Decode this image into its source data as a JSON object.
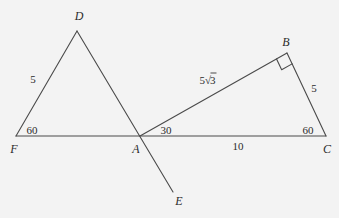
{
  "figure": {
    "background_color": "#f3f3f3",
    "stroke_color": "#4a4a4a",
    "text_color": "#2b2b2b",
    "width": 339,
    "height": 218
  },
  "points": {
    "F": {
      "label": "F",
      "x": 16,
      "y": 136,
      "label_x": 14,
      "label_y": 149
    },
    "A": {
      "label": "A",
      "x": 140,
      "y": 136,
      "label_x": 136,
      "label_y": 149
    },
    "C": {
      "label": "C",
      "x": 326,
      "y": 136,
      "label_x": 327,
      "label_y": 149
    },
    "D": {
      "label": "D",
      "x": 77,
      "y": 31,
      "label_x": 79,
      "label_y": 16
    },
    "B": {
      "label": "B",
      "x": 287,
      "y": 53,
      "label_x": 286,
      "label_y": 42
    },
    "E": {
      "label": "E",
      "x": 173,
      "y": 192,
      "label_x": 179,
      "label_y": 201
    }
  },
  "segments": [
    {
      "name": "baseline-F-C",
      "from": "F",
      "to": "C"
    },
    {
      "name": "side-F-D",
      "from": "F",
      "to": "D"
    },
    {
      "name": "ray-D-E",
      "from": "D",
      "to": "E"
    },
    {
      "name": "side-A-B",
      "from": "A",
      "to": "B"
    },
    {
      "name": "side-B-C",
      "from": "B",
      "to": "C"
    }
  ],
  "right_angle_marker": {
    "name": "right-angle-at-B",
    "vertex": "B",
    "size": 12
  },
  "measures": {
    "fd_length": {
      "text": "5",
      "x": 33,
      "y": 79
    },
    "angle_f": {
      "text": "60",
      "x": 32,
      "y": 130
    },
    "angle_a": {
      "text": "30",
      "x": 166,
      "y": 130
    },
    "ab_length_prefix": "5",
    "ab_length_radicand": "3",
    "ab_length_x": 208,
    "ab_length_y": 80,
    "bc_length": {
      "text": "5",
      "x": 314,
      "y": 88
    },
    "ac_length": {
      "text": "10",
      "x": 238,
      "y": 146
    },
    "angle_c": {
      "text": "60",
      "x": 308,
      "y": 130
    }
  }
}
